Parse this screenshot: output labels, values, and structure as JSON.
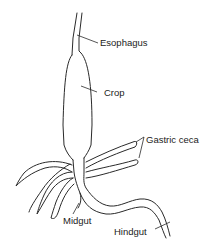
{
  "diagram": {
    "type": "anatomical-illustration",
    "labels": [
      {
        "id": "esophagus",
        "text": "Esophagus"
      },
      {
        "id": "crop",
        "text": "Crop"
      },
      {
        "id": "gastric_ceca",
        "text": "Gastric ceca"
      },
      {
        "id": "midgut",
        "text": "Midgut"
      },
      {
        "id": "hindgut",
        "text": "Hindgut"
      }
    ],
    "colors": {
      "stroke": "#2a2a2a",
      "text": "#222222",
      "background": "#ffffff"
    }
  }
}
